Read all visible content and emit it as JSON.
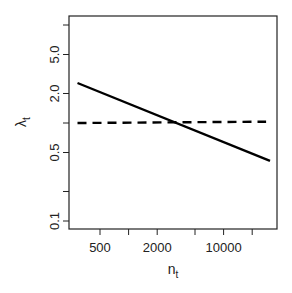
{
  "chart_data": {
    "type": "line",
    "title": "",
    "xlabel": "n",
    "xlabel_subscript": "t",
    "ylabel": "λ",
    "ylabel_subscript": "t",
    "xscale": "log",
    "yscale": "log",
    "xlim": [
      280,
      32000
    ],
    "ylim": [
      0.085,
      12
    ],
    "x_ticks": [
      500,
      1000,
      2000,
      5000,
      10000,
      20000
    ],
    "x_tick_labels": [
      "500",
      "",
      "2000",
      "",
      "10000",
      ""
    ],
    "y_ticks": [
      0.1,
      0.2,
      0.5,
      1,
      2,
      5,
      10
    ],
    "y_tick_labels": [
      "0.1",
      "",
      "0.5",
      "",
      "2.0",
      "5.0",
      ""
    ],
    "grid": false,
    "legend": null,
    "series": [
      {
        "name": "solid",
        "style": "solid",
        "color": "#000000",
        "x": [
          290,
          30800
        ],
        "y": [
          2.56,
          0.41
        ]
      },
      {
        "name": "dashed",
        "style": "dashed",
        "color": "#000000",
        "x": [
          290,
          28000
        ],
        "y": [
          1.0,
          1.03
        ]
      }
    ]
  }
}
